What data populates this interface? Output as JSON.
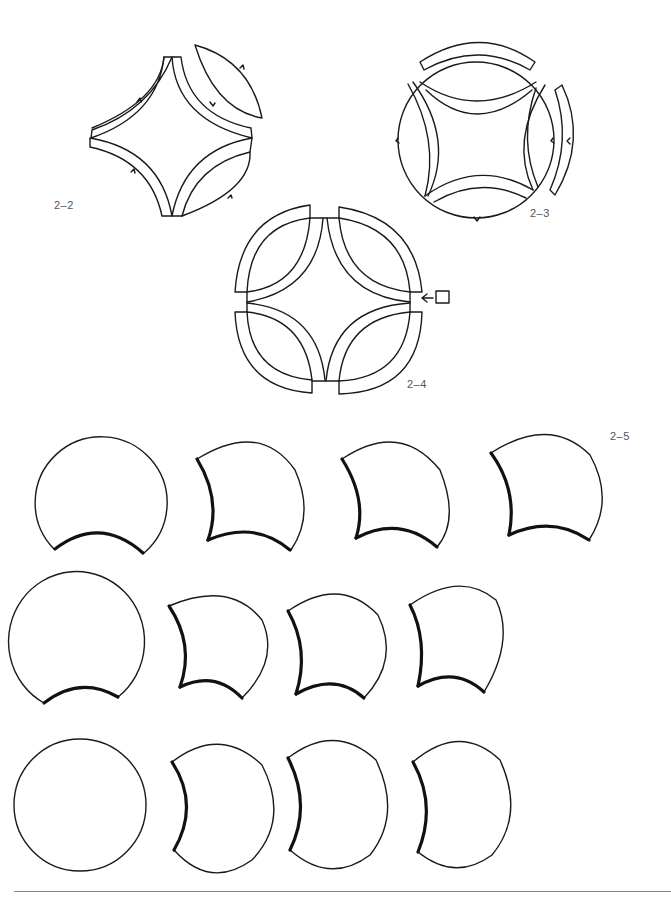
{
  "figures": [
    {
      "id": "2-2",
      "label": "2–2",
      "description": "Four arc wedges arranged around a concave square center, with one separated melon-shaped piece at top right; small notch marks on outer arcs"
    },
    {
      "id": "2-3",
      "label": "2–3",
      "description": "Circle block with four arc bands around a concave square; top arc band lifted off, right arc band separated"
    },
    {
      "id": "2-4",
      "label": "2–4",
      "description": "Circle divided into four quarter pieces each containing an arc band; arrow pointing to a small square at the right seam"
    },
    {
      "id": "2-5",
      "label": "2–5",
      "description": "Grid of 12 template shapes: circles with one or two concave bites, thickened curve marks the seam edge"
    }
  ],
  "annotations": {
    "arrow_symbol": "←",
    "square_marker": "□"
  },
  "grid_2_5": {
    "rows": 3,
    "cols": 4,
    "row_descriptions": [
      "Row 1: circle with bottom bite; three shapes with left and bottom bites",
      "Row 2: circle with bottom bite; three shapes with left and bottom bites",
      "Row 3: plain circle; three crescents with left bite"
    ]
  },
  "colors": {
    "stroke": "#1a1a1a",
    "label": "#555555",
    "rule": "#8a8a8a",
    "background": "#ffffff"
  }
}
